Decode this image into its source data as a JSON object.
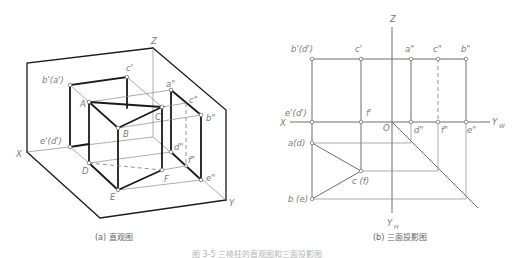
{
  "left_view": {
    "caption": "(a) 直观图",
    "labels": {
      "Z": "Z",
      "X": "X",
      "Y": "Y",
      "b_prime_a_prime": "b'(a')",
      "c_prime": "c'",
      "e_prime_d_prime": "e'(d')",
      "A": "A",
      "B": "B",
      "C": "C",
      "D": "D",
      "E": "E",
      "F": "F",
      "a_dprime": "a\"",
      "b_dprime": "b\"",
      "c_dprime": "c\"",
      "d_dprime": "d\"",
      "e_dprime": "e\"",
      "f_dprime": "f\""
    }
  },
  "right_view": {
    "caption": "(b) 三面投影图",
    "labels": {
      "Z": "Z",
      "X": "X",
      "O": "O",
      "YW": "Y",
      "YW_sub": "W",
      "YH": "Y",
      "YH_sub": "H",
      "b_prime_d_prime": "b'(d')",
      "c_prime": "c'",
      "a_dprime": "a\"",
      "c_dprime": "c\"",
      "b_dprime": "b\"",
      "e_prime_d_prime": "e'(d')",
      "f_prime": "f'",
      "d_dprime": "d\"",
      "f_dprime": "f\"",
      "e_dprime": "e\"",
      "a_d": "a(d)",
      "c_f": "c (f)",
      "b_e": "b (e)"
    }
  },
  "figure_caption": "图 3-5   三棱柱的直观图和三面投影图",
  "colors": {
    "line": "#1a1a1a",
    "thin_line": "#8a8a8a",
    "label": "#7a7a7a"
  }
}
